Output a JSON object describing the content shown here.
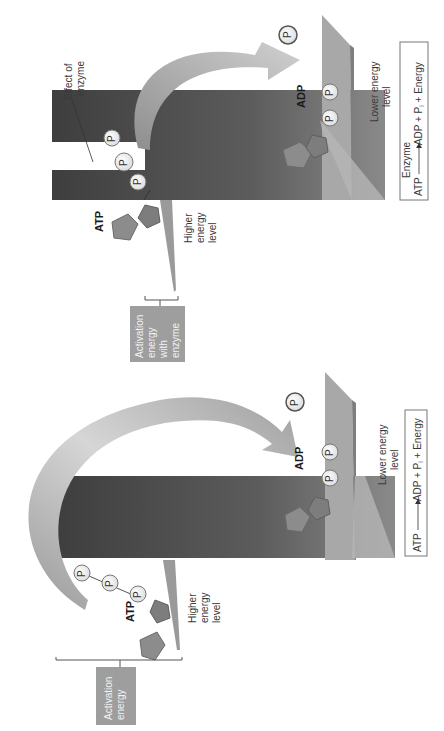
{
  "panels": {
    "with_enzyme": {
      "activation_label": [
        "Activation",
        "energy",
        "with",
        "enzyme"
      ],
      "higher_label": [
        "Higher",
        "energy",
        "level"
      ],
      "lower_label": [
        "Lower energy",
        "level"
      ],
      "effect_label": [
        "Effect of",
        "enzyme"
      ],
      "atp_label": "ATP",
      "adp_label": "ADP",
      "p_label": "P",
      "pi_label": "P",
      "pi_sub": "i",
      "equation": {
        "left": "ATP",
        "enzyme": "Enzyme",
        "right": "ADP + P",
        "sub": "i",
        "tail": " + Energy"
      }
    },
    "without_enzyme": {
      "activation_label": [
        "Activation",
        "energy"
      ],
      "higher_label": [
        "Higher",
        "energy",
        "level"
      ],
      "lower_label": [
        "Lower energy",
        "level"
      ],
      "atp_label": "ATP",
      "adp_label": "ADP",
      "p_label": "P",
      "pi_label": "P",
      "pi_sub": "i",
      "equation": {
        "left": "ATP",
        "right": "ADP + P",
        "sub": "i",
        "tail": " + Energy"
      }
    }
  },
  "colors": {
    "dark_block": "#4a4a4a",
    "mid_block": "#7a7a7a",
    "plane": "#a8a8a8",
    "plane_edge": "#8a8a8a",
    "arrow": "#bdbdbd",
    "label_box": "#9e9e9e",
    "molecule": "#8c8c8c",
    "phosphate": "#f4f4f4"
  }
}
